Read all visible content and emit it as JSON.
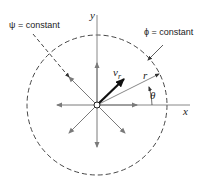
{
  "diagram": {
    "labels": {
      "psi_constant": "ψ = constant",
      "phi_constant": "ϕ = constant",
      "x_axis": "x",
      "y_axis": "y",
      "r": "r",
      "theta": "θ",
      "v_r_main": "v",
      "v_r_sub": "r"
    },
    "colors": {
      "axes": "#7a7a7a",
      "radial_arrows": "#7a7a7a",
      "velocity_arrow": "#111111",
      "dashed_circle": "#333333",
      "text": "#222222"
    },
    "geometry": {
      "origin": [
        97,
        105
      ],
      "circle_radius": 70,
      "radial_arrow_angles_deg": [
        0,
        45,
        90,
        135,
        180,
        225,
        270,
        315
      ],
      "velocity_angle_deg": 45,
      "r_angle_deg": 27
    }
  }
}
